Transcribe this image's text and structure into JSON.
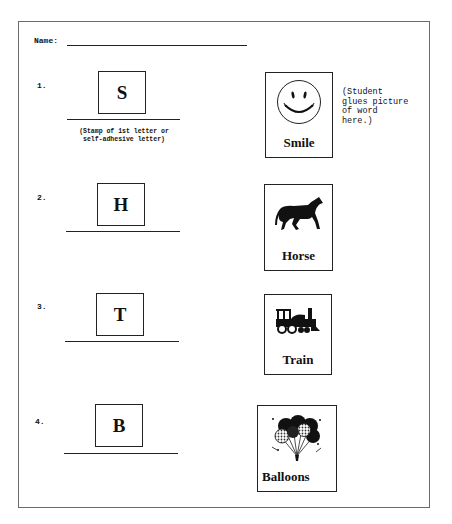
{
  "worksheet": {
    "name_label": "Name:",
    "glue_note": "(Student\nglues picture\nof word\nhere.)",
    "stamp_note_line1": "(Stamp of 1st letter or",
    "stamp_note_line2": "self-adhesive letter)",
    "items": [
      {
        "number": "1.",
        "letter": "S",
        "word": "Smile",
        "icon": "smiley-face-icon"
      },
      {
        "number": "2.",
        "letter": "H",
        "word": "Horse",
        "icon": "horse-icon"
      },
      {
        "number": "3.",
        "letter": "T",
        "word": "Train",
        "icon": "train-icon"
      },
      {
        "number": "4.",
        "letter": "B",
        "word": "Balloons",
        "icon": "balloons-icon"
      }
    ]
  }
}
